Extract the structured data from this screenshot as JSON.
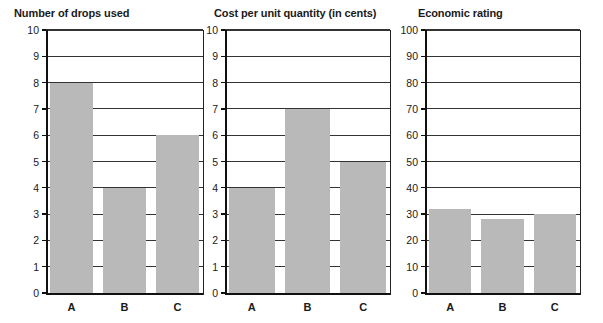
{
  "page": {
    "background": "#ffffff",
    "bar_color": "#b9b9b9",
    "axis_color": "#111111",
    "grid_color": "#333333"
  },
  "chart_data": [
    {
      "type": "bar",
      "title": "Number of drops used",
      "categories": [
        "A",
        "B",
        "C"
      ],
      "values": [
        8,
        4,
        6
      ],
      "xlabel": "",
      "ylabel": "",
      "ylim": [
        0,
        10
      ],
      "yticks": [
        0,
        1,
        2,
        3,
        4,
        5,
        6,
        7,
        8,
        9,
        10
      ],
      "ytick_labels": [
        "0",
        "1",
        "2",
        "3",
        "4",
        "5",
        "6",
        "7",
        "8",
        "9",
        "10"
      ],
      "grid": true,
      "legend": false
    },
    {
      "type": "bar",
      "title": "Cost per unit quantity (in cents)",
      "categories": [
        "A",
        "B",
        "C"
      ],
      "values": [
        4,
        7,
        5
      ],
      "xlabel": "",
      "ylabel": "",
      "ylim": [
        0,
        10
      ],
      "yticks": [
        0,
        1,
        2,
        3,
        4,
        5,
        6,
        7,
        8,
        9,
        10
      ],
      "ytick_labels": [
        "0",
        "1",
        "2",
        "3",
        "4",
        "5",
        "6",
        "7",
        "8",
        "9",
        "10"
      ],
      "grid": true,
      "legend": false
    },
    {
      "type": "bar",
      "title": "Economic rating",
      "categories": [
        "A",
        "B",
        "C"
      ],
      "values": [
        32,
        28,
        30
      ],
      "xlabel": "",
      "ylabel": "",
      "ylim": [
        0,
        100
      ],
      "yticks": [
        0,
        10,
        20,
        30,
        40,
        50,
        60,
        70,
        80,
        90,
        100
      ],
      "ytick_labels": [
        "0",
        "10",
        "20",
        "30",
        "40",
        "50",
        "60",
        "70",
        "80",
        "90",
        "100"
      ],
      "grid": true,
      "legend": false
    }
  ]
}
